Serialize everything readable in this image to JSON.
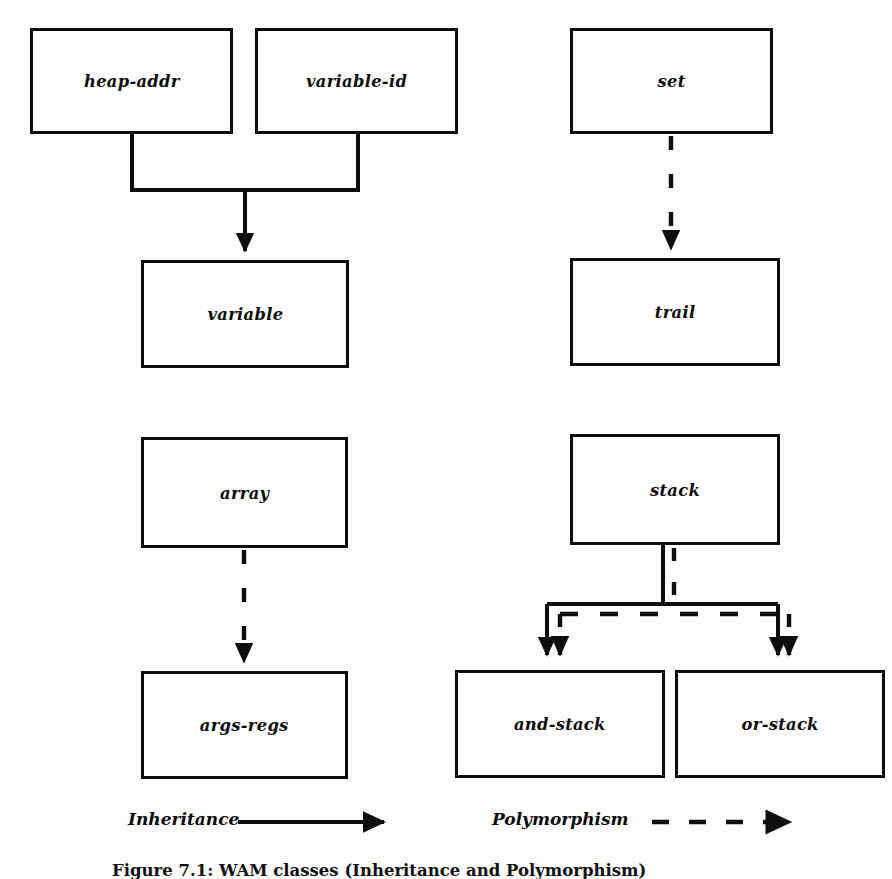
{
  "figure": {
    "caption": "Figure 7.1: WAM classes (Inheritance and Polymorphism)",
    "ink_color": "#0d0d0d",
    "paper_color": "#fdfdfc"
  },
  "nodes": [
    {
      "id": "heap-addr",
      "label": "heap-addr",
      "x": 30,
      "y": 28,
      "w": 203,
      "h": 106
    },
    {
      "id": "variable-id",
      "label": "variable-id",
      "x": 255,
      "y": 28,
      "w": 203,
      "h": 106
    },
    {
      "id": "set",
      "label": "set",
      "x": 570,
      "y": 28,
      "w": 203,
      "h": 106
    },
    {
      "id": "variable",
      "label": "variable",
      "x": 141,
      "y": 260,
      "w": 208,
      "h": 108
    },
    {
      "id": "trail",
      "label": "trail",
      "x": 570,
      "y": 258,
      "w": 210,
      "h": 108
    },
    {
      "id": "array",
      "label": "array",
      "x": 141,
      "y": 437,
      "w": 207,
      "h": 111
    },
    {
      "id": "stack",
      "label": "stack",
      "x": 570,
      "y": 434,
      "w": 210,
      "h": 111
    },
    {
      "id": "args-regs",
      "label": "args-regs",
      "x": 141,
      "y": 671,
      "w": 207,
      "h": 108
    },
    {
      "id": "and-stack",
      "label": "and-stack",
      "x": 455,
      "y": 670,
      "w": 210,
      "h": 108
    },
    {
      "id": "or-stack",
      "label": "or-stack",
      "x": 675,
      "y": 670,
      "w": 210,
      "h": 108
    }
  ],
  "edges": [
    {
      "from": "heap-addr",
      "to": "variable",
      "kind": "inheritance"
    },
    {
      "from": "variable-id",
      "to": "variable",
      "kind": "inheritance"
    },
    {
      "from": "set",
      "to": "trail",
      "kind": "polymorphism"
    },
    {
      "from": "array",
      "to": "args-regs",
      "kind": "polymorphism"
    },
    {
      "from": "stack",
      "to": "and-stack",
      "kind": "inheritance"
    },
    {
      "from": "stack",
      "to": "and-stack",
      "kind": "polymorphism"
    },
    {
      "from": "stack",
      "to": "or-stack",
      "kind": "inheritance"
    },
    {
      "from": "stack",
      "to": "or-stack",
      "kind": "polymorphism"
    }
  ],
  "legend": {
    "inheritance": {
      "label": "Inheritance",
      "x": 128,
      "y": 806,
      "style": "solid-arrow"
    },
    "polymorphism": {
      "label": "Polymorphism",
      "x": 492,
      "y": 806,
      "style": "dashed-arrow"
    }
  }
}
